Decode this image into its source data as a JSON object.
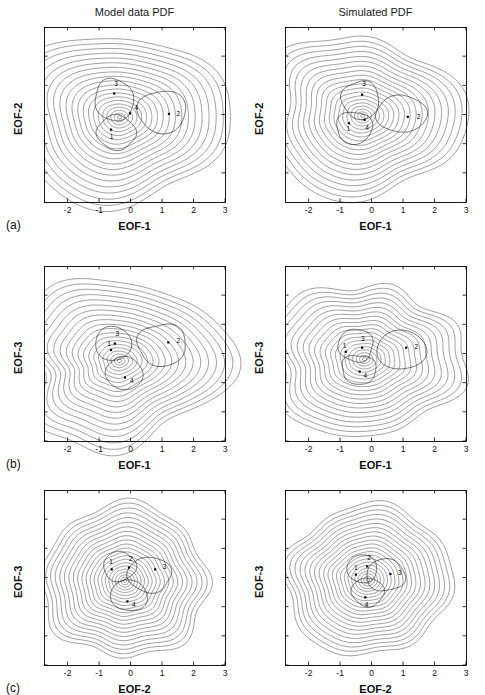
{
  "figure": {
    "width": 485,
    "height": 683,
    "background": "#ffffff",
    "ink_color": "#1c1c1c"
  },
  "columns": [
    {
      "key": "model",
      "title": "Model data PDF"
    },
    {
      "key": "simulated",
      "title": "Simulated PDF"
    }
  ],
  "rows": [
    {
      "key": "a",
      "label": "(a)",
      "xlabel": "EOF-1",
      "ylabel": "EOF-2"
    },
    {
      "key": "b",
      "label": "(b)",
      "xlabel": "EOF-1",
      "ylabel": "EOF-3"
    },
    {
      "key": "c",
      "label": "(c)",
      "xlabel": "EOF-2",
      "ylabel": "EOF-3"
    }
  ],
  "axes": {
    "xticks": [
      -2,
      -1,
      0,
      1,
      2,
      3
    ],
    "xtick_labels": [
      "-2",
      "-1",
      "0",
      "1",
      "2",
      "3"
    ],
    "xlim": [
      -2.75,
      3.0
    ],
    "ylim": [
      -3.0,
      3.0
    ],
    "yticks_row_a": [
      -2,
      -1,
      0,
      1,
      2,
      3
    ],
    "ytick_labels_row_a": [
      "-2",
      "-1",
      "0",
      "1",
      "2",
      "3"
    ],
    "yticks_row_bc": [
      -3,
      -2,
      -1,
      0,
      1,
      2
    ],
    "ytick_labels_row_bc": [
      "-3",
      "-2",
      "-1",
      "0",
      "1",
      "2"
    ]
  },
  "chart_data": {
    "type": "line",
    "panels": [
      {
        "id": "a-model",
        "row": "a",
        "column": "model",
        "title": "Model data PDF",
        "xlabel": "EOF-1",
        "ylabel": "EOF-2",
        "xlim": [
          -2.75,
          3.0
        ],
        "ylim": [
          -3.0,
          3.0
        ],
        "grid": false,
        "contour_levels": 20,
        "shape": "three-lobed, broad lobe toward positive EOF-1",
        "center": [
          -0.35,
          -0.1
        ],
        "radius_outer": [
          2.9,
          2.55
        ],
        "lobe_angles_deg": [
          10,
          140,
          255
        ],
        "lobe_amp": 0.26,
        "markers": [
          {
            "label": "1",
            "x": -0.62,
            "y": -0.52,
            "label_dx": 0.02,
            "label_dy": -0.24
          },
          {
            "label": "2",
            "x": 1.22,
            "y": 0.02,
            "label_dx": 0.3,
            "label_dy": 0.0
          },
          {
            "label": "3",
            "x": -0.52,
            "y": 0.72,
            "label_dx": 0.06,
            "label_dy": 0.34
          },
          {
            "label": "4",
            "x": -0.02,
            "y": 0.04,
            "label_dx": 0.2,
            "label_dy": 0.18
          }
        ],
        "trajectory_loops": [
          {
            "center": [
              -0.52,
              0.5
            ],
            "rx": 0.62,
            "ry": 0.72,
            "rot_deg": 10
          },
          {
            "center": [
              1.0,
              0.1
            ],
            "rx": 0.78,
            "ry": 0.72,
            "rot_deg": 0
          },
          {
            "center": [
              -0.45,
              -0.62
            ],
            "rx": 0.62,
            "ry": 0.58,
            "rot_deg": -15
          }
        ]
      },
      {
        "id": "a-simulated",
        "row": "a",
        "column": "simulated",
        "title": "Simulated PDF",
        "xlabel": "EOF-1",
        "ylabel": "EOF-2",
        "xlim": [
          -2.75,
          3.0
        ],
        "ylim": [
          -3.0,
          3.0
        ],
        "grid": false,
        "contour_levels": 20,
        "shape": "rounded triangular, smoother than model",
        "center": [
          -0.28,
          -0.05
        ],
        "radius_outer": [
          2.8,
          2.45
        ],
        "lobe_angles_deg": [
          5,
          135,
          250
        ],
        "lobe_amp": 0.2,
        "markers": [
          {
            "label": "1",
            "x": -0.72,
            "y": -0.3,
            "label_dx": -0.02,
            "label_dy": -0.2
          },
          {
            "label": "2",
            "x": 1.15,
            "y": -0.08,
            "label_dx": 0.34,
            "label_dy": 0.0
          },
          {
            "label": "3",
            "x": -0.3,
            "y": 0.68,
            "label_dx": 0.06,
            "label_dy": 0.36
          },
          {
            "label": "4",
            "x": -0.22,
            "y": -0.18,
            "label_dx": 0.08,
            "label_dy": -0.26
          }
        ],
        "trajectory_loops": [
          {
            "center": [
              -0.35,
              0.5
            ],
            "rx": 0.6,
            "ry": 0.65,
            "rot_deg": 8
          },
          {
            "center": [
              0.95,
              0.02
            ],
            "rx": 0.82,
            "ry": 0.62,
            "rot_deg": 0
          },
          {
            "center": [
              -0.55,
              -0.45
            ],
            "rx": 0.58,
            "ry": 0.55,
            "rot_deg": -20
          }
        ]
      },
      {
        "id": "b-model",
        "row": "b",
        "column": "model",
        "title": "Model data PDF",
        "xlabel": "EOF-1",
        "ylabel": "EOF-3",
        "xlim": [
          -2.75,
          3.0
        ],
        "ylim": [
          -3.0,
          3.0
        ],
        "grid": false,
        "contour_levels": 20,
        "shape": "irregular three-lobed with ridge toward positive EOF-1",
        "center": [
          -0.35,
          -0.25
        ],
        "radius_outer": [
          2.85,
          2.4
        ],
        "lobe_angles_deg": [
          5,
          130,
          250
        ],
        "lobe_amp": 0.3,
        "markers": [
          {
            "label": "1",
            "x": -0.62,
            "y": 0.12,
            "label_dx": -0.06,
            "label_dy": 0.22
          },
          {
            "label": "2",
            "x": 1.2,
            "y": 0.38,
            "label_dx": 0.32,
            "label_dy": 0.06
          },
          {
            "label": "3",
            "x": -0.5,
            "y": 0.34,
            "label_dx": 0.08,
            "label_dy": 0.34
          },
          {
            "label": "4",
            "x": -0.18,
            "y": -0.82,
            "label_dx": 0.22,
            "label_dy": -0.12
          }
        ],
        "trajectory_loops": [
          {
            "center": [
              -0.55,
              0.34
            ],
            "rx": 0.58,
            "ry": 0.58,
            "rot_deg": 12
          },
          {
            "center": [
              1.0,
              0.3
            ],
            "rx": 0.78,
            "ry": 0.72,
            "rot_deg": 0
          },
          {
            "center": [
              -0.2,
              -0.68
            ],
            "rx": 0.6,
            "ry": 0.55,
            "rot_deg": -20
          }
        ]
      },
      {
        "id": "b-simulated",
        "row": "b",
        "column": "simulated",
        "title": "Simulated PDF",
        "xlabel": "EOF-1",
        "ylabel": "EOF-3",
        "xlim": [
          -2.75,
          3.0
        ],
        "ylim": [
          -3.0,
          3.0
        ],
        "grid": false,
        "contour_levels": 20,
        "shape": "rounded, nearly elliptical with slight eastward extension",
        "center": [
          -0.22,
          -0.2
        ],
        "radius_outer": [
          2.8,
          2.4
        ],
        "lobe_angles_deg": [
          0,
          130,
          245
        ],
        "lobe_amp": 0.16,
        "markers": [
          {
            "label": "1",
            "x": -0.82,
            "y": 0.06,
            "label_dx": -0.04,
            "label_dy": 0.22
          },
          {
            "label": "2",
            "x": 1.1,
            "y": 0.2,
            "label_dx": 0.32,
            "label_dy": 0.04
          },
          {
            "label": "3",
            "x": -0.3,
            "y": 0.2,
            "label_dx": 0.02,
            "label_dy": 0.3
          },
          {
            "label": "4",
            "x": -0.38,
            "y": -0.62,
            "label_dx": 0.18,
            "label_dy": -0.14
          }
        ],
        "trajectory_loops": [
          {
            "center": [
              -0.5,
              0.28
            ],
            "rx": 0.56,
            "ry": 0.56,
            "rot_deg": 10
          },
          {
            "center": [
              0.95,
              0.12
            ],
            "rx": 0.8,
            "ry": 0.66,
            "rot_deg": 0
          },
          {
            "center": [
              -0.4,
              -0.55
            ],
            "rx": 0.56,
            "ry": 0.5,
            "rot_deg": -18
          }
        ]
      },
      {
        "id": "c-model",
        "row": "c",
        "column": "model",
        "title": "Model data PDF",
        "xlabel": "EOF-2",
        "ylabel": "EOF-3",
        "xlim": [
          -2.75,
          3.0
        ],
        "ylim": [
          -3.0,
          3.0
        ],
        "grid": false,
        "contour_levels": 22,
        "shape": "nearly circular concentric rings",
        "center": [
          -0.18,
          -0.12
        ],
        "radius_outer": [
          2.55,
          2.5
        ],
        "lobe_angles_deg": [
          60,
          190,
          300
        ],
        "lobe_amp": 0.07,
        "markers": [
          {
            "label": "1",
            "x": -0.6,
            "y": 0.28,
            "label_dx": -0.02,
            "label_dy": 0.26
          },
          {
            "label": "2",
            "x": -0.05,
            "y": 0.34,
            "label_dx": 0.06,
            "label_dy": 0.3
          },
          {
            "label": "3",
            "x": 0.78,
            "y": 0.28,
            "label_dx": 0.3,
            "label_dy": 0.1
          },
          {
            "label": "4",
            "x": -0.1,
            "y": -0.82,
            "label_dx": 0.2,
            "label_dy": -0.1
          }
        ],
        "trajectory_loops": [
          {
            "center": [
              -0.35,
              0.38
            ],
            "rx": 0.52,
            "ry": 0.5,
            "rot_deg": 20
          },
          {
            "center": [
              0.6,
              0.1
            ],
            "rx": 0.7,
            "ry": 0.6,
            "rot_deg": 0
          },
          {
            "center": [
              -0.05,
              -0.62
            ],
            "rx": 0.6,
            "ry": 0.52,
            "rot_deg": -15
          }
        ]
      },
      {
        "id": "c-simulated",
        "row": "c",
        "column": "simulated",
        "title": "Simulated PDF",
        "xlabel": "EOF-2",
        "ylabel": "EOF-3",
        "xlim": [
          -2.75,
          3.0
        ],
        "ylim": [
          -3.0,
          3.0
        ],
        "grid": false,
        "contour_levels": 22,
        "shape": "nearly circular concentric rings, slightly tighter",
        "center": [
          -0.12,
          -0.08
        ],
        "radius_outer": [
          2.55,
          2.5
        ],
        "lobe_angles_deg": [
          50,
          185,
          300
        ],
        "lobe_amp": 0.06,
        "markers": [
          {
            "label": "1",
            "x": -0.5,
            "y": 0.1,
            "label_dx": 0.0,
            "label_dy": 0.24
          },
          {
            "label": "2",
            "x": -0.14,
            "y": 0.38,
            "label_dx": 0.06,
            "label_dy": 0.3
          },
          {
            "label": "3",
            "x": 0.6,
            "y": 0.12,
            "label_dx": 0.3,
            "label_dy": 0.04
          },
          {
            "label": "4",
            "x": -0.2,
            "y": -0.68,
            "label_dx": 0.04,
            "label_dy": -0.26
          }
        ],
        "trajectory_loops": [
          {
            "center": [
              -0.3,
              0.3
            ],
            "rx": 0.48,
            "ry": 0.48,
            "rot_deg": 18
          },
          {
            "center": [
              0.45,
              0.08
            ],
            "rx": 0.62,
            "ry": 0.55,
            "rot_deg": 0
          },
          {
            "center": [
              -0.12,
              -0.5
            ],
            "rx": 0.52,
            "ry": 0.48,
            "rot_deg": -12
          }
        ]
      }
    ]
  }
}
